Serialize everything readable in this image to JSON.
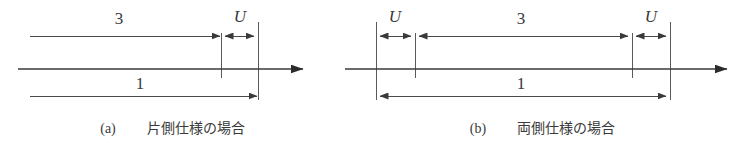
{
  "figure": {
    "background_color": "#ffffff",
    "line_color": "#4a4a4a",
    "text_color": "#3a3a3a"
  },
  "panels": [
    {
      "id": "panel-a",
      "caption_marker": "(a)",
      "caption_text": "片側仕様の場合",
      "labels": {
        "top_dimension": "3",
        "gap_dimension": "U",
        "bottom_dimension": "1"
      }
    },
    {
      "id": "panel-b",
      "caption_marker": "(b)",
      "caption_text": "両側仕様の場合",
      "labels": {
        "left_gap_dimension": "U",
        "top_dimension": "3",
        "right_gap_dimension": "U",
        "bottom_dimension": "1"
      }
    }
  ]
}
